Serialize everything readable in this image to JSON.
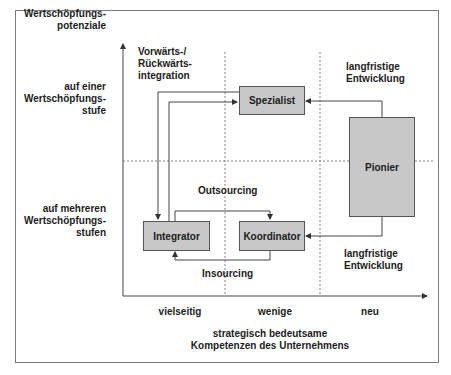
{
  "y_axis": {
    "title": [
      "Wertschöpfungs-",
      "potenziale"
    ],
    "upper_label": [
      "auf einer",
      "Wertschöpfungs-",
      "stufe"
    ],
    "lower_label": [
      "auf mehreren",
      "Wertschöpfungs-",
      "stufen"
    ]
  },
  "x_axis": {
    "categories": [
      "vielseitig",
      "wenige",
      "neu"
    ],
    "title": [
      "strategisch bedeutsame",
      "Kompetenzen des Unternehmens"
    ]
  },
  "annotations": {
    "vertical_integration": [
      "Vorwärts-/",
      "Rückwärts-",
      "integration"
    ],
    "long_term_top": [
      "langfristige",
      "Entwicklung"
    ],
    "long_term_bottom": [
      "langfristige",
      "Entwicklung"
    ],
    "outsourcing": "Outsourcing",
    "insourcing": "Insourcing"
  },
  "boxes": {
    "spezialist": "Spezialist",
    "pionier": "Pionier",
    "integrator": "Integrator",
    "koordinator": "Koordinator"
  },
  "colors": {
    "box_fill": "#c8c8c8",
    "line": "#444444",
    "frame": "#7a7a7a"
  }
}
